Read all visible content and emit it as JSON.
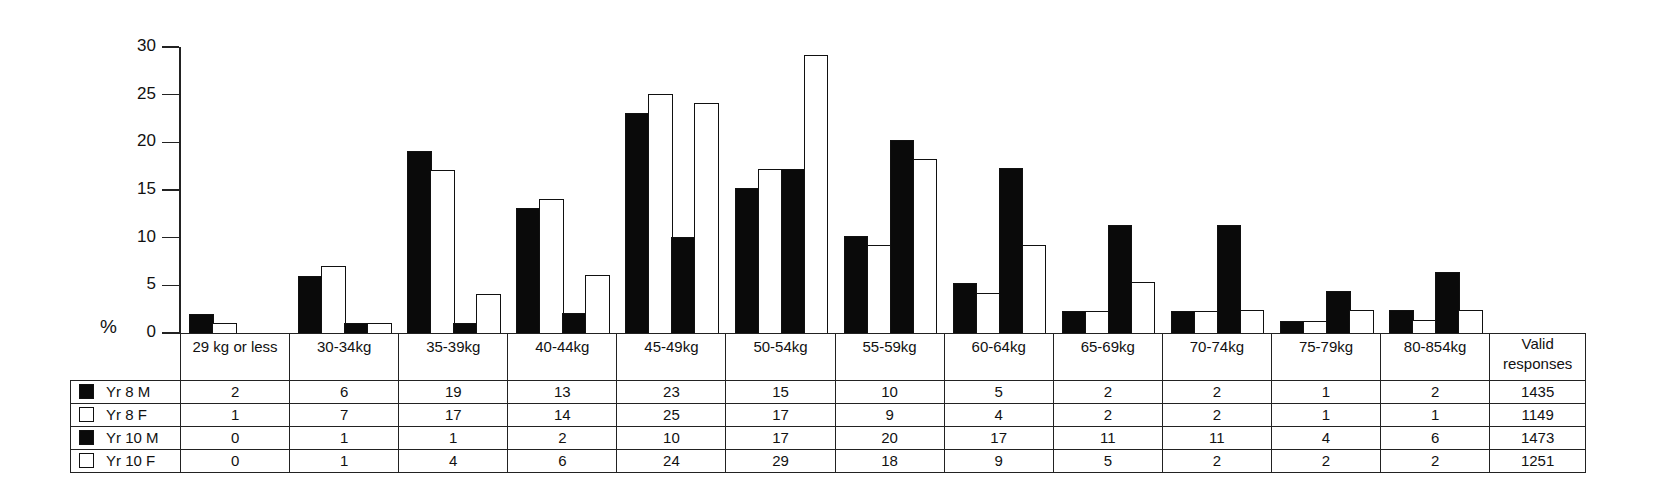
{
  "chart_data": {
    "type": "bar",
    "title": "",
    "xlabel": "",
    "ylabel": "%",
    "ylim": [
      0,
      30
    ],
    "yticks": [
      0,
      5,
      10,
      15,
      20,
      25,
      30
    ],
    "grid": false,
    "legend_position": "table rows (left of data table)",
    "categories": [
      "29 kg or less",
      "30-34kg",
      "35-39kg",
      "40-44kg",
      "45-49kg",
      "50-54kg",
      "55-59kg",
      "60-64kg",
      "65-69kg",
      "70-74kg",
      "75-79kg",
      "80-854kg"
    ],
    "series": [
      {
        "name": "Yr 8 M",
        "fill": "black",
        "values": [
          2,
          6,
          19,
          13,
          23,
          15,
          10,
          5,
          2,
          2,
          1,
          2
        ],
        "valid_responses": 1435,
        "bar_heights": [
          2,
          6,
          19.1,
          13.1,
          23.1,
          15.2,
          10.2,
          5.2,
          2.3,
          2.3,
          1.3,
          2.4
        ]
      },
      {
        "name": "Yr 8 F",
        "fill": "white",
        "values": [
          1,
          7,
          17,
          14,
          25,
          17,
          9,
          4,
          2,
          2,
          1,
          1
        ],
        "valid_responses": 1149,
        "bar_heights": [
          1,
          7,
          17.1,
          14.1,
          25.1,
          17.2,
          9.2,
          4.2,
          2.3,
          2.3,
          1.3,
          1.4
        ]
      },
      {
        "name": "Yr 10 M",
        "fill": "black",
        "values": [
          0,
          1,
          1,
          2,
          10,
          17,
          20,
          17,
          11,
          11,
          4,
          6
        ],
        "valid_responses": 1473,
        "bar_heights": [
          0,
          1,
          1.1,
          2.1,
          10.1,
          17.2,
          20.2,
          17.3,
          11.3,
          11.3,
          4.4,
          6.4
        ]
      },
      {
        "name": "Yr 10 F",
        "fill": "white",
        "values": [
          0,
          1,
          4,
          6,
          24,
          29,
          18,
          9,
          5,
          2,
          2,
          2
        ],
        "valid_responses": 1251,
        "bar_heights": [
          0,
          1,
          4.1,
          6.1,
          24.1,
          29.2,
          18.2,
          9.2,
          5.3,
          2.4,
          2.4,
          2.4
        ]
      }
    ]
  },
  "table": {
    "valid_header_line1": "Valid",
    "valid_header_line2": "responses"
  },
  "axis": {
    "unit_label": "%"
  }
}
